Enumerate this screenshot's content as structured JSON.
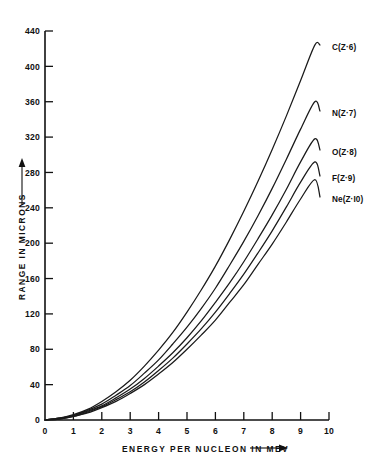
{
  "chart_data": {
    "type": "line",
    "title": "",
    "xlabel": "ENERGY PER NUCLEON IN MEV",
    "ylabel": "RANGE IN MICRONS",
    "xlabel_arrow": "⟶",
    "ylabel_arrow": "↑",
    "xlim": [
      0,
      10
    ],
    "ylim": [
      0,
      440
    ],
    "grid": false,
    "legend_position": "inline-right-end-of-curve",
    "xticks": [
      0,
      1,
      2,
      3,
      4,
      5,
      6,
      7,
      8,
      9,
      10
    ],
    "xticklabels": [
      "0",
      "1",
      "2",
      "3",
      "4",
      "5",
      "6",
      "7",
      "8",
      "9",
      "10"
    ],
    "yticks": [
      0,
      40,
      80,
      120,
      160,
      200,
      240,
      280,
      320,
      360,
      400,
      440
    ],
    "yticklabels": [
      "0",
      "40",
      "80",
      "120",
      "160",
      "200",
      "240",
      "280",
      "320",
      "360",
      "400",
      "440"
    ],
    "x": [
      0,
      0.5,
      1,
      1.5,
      2,
      2.5,
      3,
      3.5,
      4,
      4.5,
      5,
      5.5,
      6,
      6.5,
      7,
      7.5,
      8,
      8.5,
      9,
      9.5,
      10
    ],
    "series": [
      {
        "name": "C(Z=6)",
        "element": "C",
        "z": 6,
        "label": "C(Z·6)",
        "values": [
          0,
          2,
          6,
          12,
          21,
          32,
          45,
          61,
          79,
          99,
          122,
          147,
          174,
          204,
          236,
          270,
          306,
          344,
          384,
          424,
          418
        ]
      },
      {
        "name": "N(Z=7)",
        "element": "N",
        "z": 7,
        "label": "N(Z·7)",
        "values": [
          0,
          2,
          5,
          11,
          18,
          28,
          39,
          53,
          68,
          86,
          105,
          126,
          149,
          175,
          202,
          231,
          262,
          295,
          329,
          360,
          360
        ]
      },
      {
        "name": "O(Z=8)",
        "element": "O",
        "z": 8,
        "label": "O(Z·8)",
        "values": [
          0,
          2,
          5,
          10,
          16,
          25,
          35,
          47,
          61,
          76,
          93,
          112,
          133,
          155,
          179,
          205,
          232,
          261,
          292,
          318,
          318
        ]
      },
      {
        "name": "F(Z=9)",
        "element": "F",
        "z": 9,
        "label": "F(Z·9)",
        "values": [
          0,
          1,
          4,
          9,
          15,
          23,
          32,
          43,
          56,
          70,
          86,
          103,
          122,
          143,
          165,
          189,
          214,
          241,
          269,
          292,
          292
        ]
      },
      {
        "name": "Ne(Z=10)",
        "element": "Ne",
        "z": 10,
        "label": "Ne(Z·I0)",
        "values": [
          0,
          1,
          4,
          8,
          14,
          21,
          30,
          40,
          52,
          65,
          80,
          96,
          113,
          133,
          153,
          176,
          199,
          224,
          250,
          272,
          272
        ]
      }
    ]
  }
}
